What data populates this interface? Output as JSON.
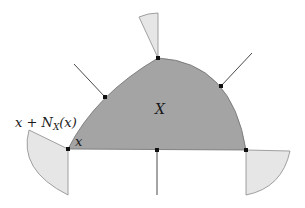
{
  "diagram": {
    "set_label": "X",
    "point_label": "x",
    "cone_label": "x + N",
    "cone_label_sub": "X",
    "cone_label_arg": "(x)",
    "colors": {
      "set_fill": "#a4a4a4",
      "set_stroke": "#6e6e6e",
      "cone_fill": "#e6e6e6",
      "cone_stroke": "#8a8a8a",
      "normal_line": "#4a4a4a",
      "point": "#111111"
    },
    "points": [
      {
        "name": "corner-left",
        "x": 68,
        "y": 149
      },
      {
        "name": "left-boundary",
        "x": 105,
        "y": 97
      },
      {
        "name": "top",
        "x": 158,
        "y": 58
      },
      {
        "name": "right-boundary",
        "x": 221,
        "y": 86
      },
      {
        "name": "corner-right",
        "x": 246,
        "y": 150
      },
      {
        "name": "bottom-mid",
        "x": 157,
        "y": 150
      }
    ]
  }
}
